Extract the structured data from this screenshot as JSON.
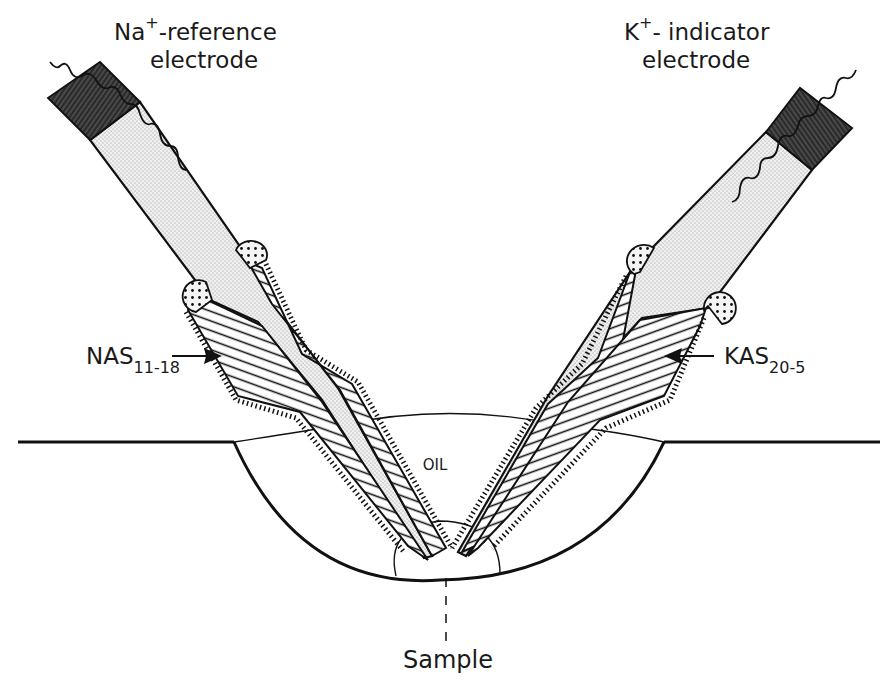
{
  "diagram": {
    "labels": {
      "left_electrode": {
        "ion": "Na",
        "charge": "+",
        "line1_rest": "-reference",
        "line2": "electrode"
      },
      "right_electrode": {
        "ion": "K",
        "charge": "+",
        "line1_rest": "- indicator",
        "line2": "electrode"
      },
      "left_glass": {
        "main": "NAS",
        "subscript": "11-18"
      },
      "right_glass": {
        "main": "KAS",
        "subscript": "20-5"
      },
      "oil": "OIL",
      "sample": "Sample"
    },
    "components": [
      "electrode-cap-hatched",
      "electrolyte-filled-barrel",
      "lead-wire",
      "sealing-wax-blob",
      "hatched-glass-taper",
      "oil-chamber",
      "sample-droplet"
    ],
    "colors": {
      "ink": "#1a1a1a",
      "paper": "#ffffff",
      "stipple": "#e6e6e6"
    }
  }
}
